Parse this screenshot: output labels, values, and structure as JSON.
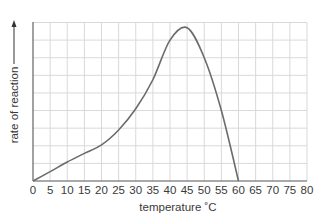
{
  "chart_data": {
    "type": "line",
    "title": "",
    "xlabel": "temperature ˚C",
    "ylabel": "rate of reaction",
    "x": [
      0,
      5,
      10,
      15,
      20,
      25,
      30,
      35,
      40,
      45,
      50,
      55,
      60
    ],
    "series": [
      {
        "name": "rate of reaction",
        "values": [
          0,
          0.53,
          1.08,
          1.57,
          2.05,
          2.9,
          4.1,
          5.75,
          8.0,
          8.7,
          7.0,
          4.0,
          0
        ]
      }
    ],
    "xticks": [
      0,
      5,
      10,
      15,
      20,
      25,
      30,
      35,
      40,
      45,
      50,
      55,
      60,
      65,
      70,
      75,
      80
    ],
    "xlim": [
      0,
      80
    ],
    "ylim": [
      0,
      9
    ],
    "y_gridlines": 9,
    "grid": true,
    "legend": null,
    "yaxis_arrow": true,
    "line_color": "#6b6b6b",
    "grid_color": "#d9d9d9"
  }
}
